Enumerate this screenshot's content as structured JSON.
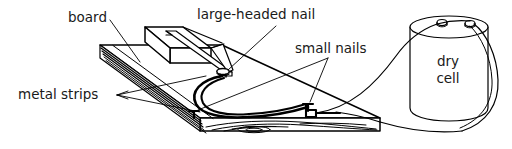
{
  "figure": {
    "type": "labeled-line-diagram",
    "background_color": "#ffffff",
    "ink_color": "#000000",
    "width": 512,
    "height": 149,
    "labels": [
      {
        "id": "board",
        "text": "board",
        "x": 68,
        "y": 22,
        "anchor": "start",
        "points_to": "wooden base board top surface"
      },
      {
        "id": "large-headed-nail",
        "text": "large-headed nail",
        "x": 197,
        "y": 19,
        "anchor": "start",
        "points_to": "nail with large flat head near centre of board"
      },
      {
        "id": "small-nails",
        "text": "small nails",
        "x": 295,
        "y": 53,
        "anchor": "start",
        "points_to": "two small nails holding the contact strip"
      },
      {
        "id": "metal-strips",
        "text": "metal strips",
        "x": 18,
        "y": 99,
        "anchor": "start",
        "points_to": "stacked springy metal strips along board edge"
      },
      {
        "id": "dry-cell-line-1",
        "text": "dry",
        "x": 448,
        "y": 66,
        "anchor": "middle",
        "points_to": "cylindrical battery"
      },
      {
        "id": "dry-cell-line-2",
        "text": "cell",
        "x": 448,
        "y": 83,
        "anchor": "middle",
        "points_to": "cylindrical battery"
      }
    ],
    "components": [
      {
        "id": "board",
        "kind": "wooden-board",
        "note": "flat rectangular slab drawn in oblique projection with wood grain on front edge"
      },
      {
        "id": "block",
        "kind": "wooden-block",
        "note": "small raised box mounted on the board, left of centre"
      },
      {
        "id": "spring-strip",
        "kind": "metal-strip",
        "note": "long strip running from block over to large-headed nail"
      },
      {
        "id": "contact-strip",
        "kind": "metal-strip",
        "note": "curved strip between small nails"
      },
      {
        "id": "large-headed-nail",
        "kind": "nail",
        "note": "ellipse head contact point"
      },
      {
        "id": "small-nail-left",
        "kind": "nail"
      },
      {
        "id": "small-nail-right",
        "kind": "nail"
      },
      {
        "id": "dry-cell",
        "kind": "cylindrical-battery",
        "terminals": 2
      },
      {
        "id": "wire-upper",
        "kind": "wire",
        "note": "runs from board contact up to left terminal of dry cell"
      },
      {
        "id": "wire-lower",
        "kind": "wire",
        "note": "runs from board right edge under and around the dry cell to right terminal"
      }
    ]
  }
}
